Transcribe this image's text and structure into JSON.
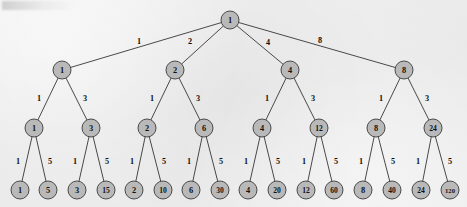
{
  "figure": {
    "kind": "divisor-tree-diagram",
    "caption": "",
    "background_color": "#ebebeb",
    "node_fill_color": "#b9b9b9",
    "node_stroke_color": "#3a3a3a",
    "edge_color": "#2a2a2a",
    "text_color": "#111111"
  },
  "chart_data": {
    "type": "diagram",
    "title": "",
    "layout": "top-down rooted tree, 4 levels, root has 4 children, all other internal nodes have 2 children",
    "levels": [
      {
        "level": 0,
        "y": 20,
        "node_count": 1
      },
      {
        "level": 1,
        "y": 70,
        "node_count": 4
      },
      {
        "level": 2,
        "y": 128,
        "node_count": 8
      },
      {
        "level": 3,
        "y": 190,
        "node_count": 16
      }
    ],
    "nodes": [
      {
        "id": "n0",
        "label": "1",
        "level": 0,
        "x": 230,
        "y": 20,
        "r": 9
      },
      {
        "id": "n1",
        "label": "1",
        "level": 1,
        "x": 62,
        "y": 70,
        "r": 9
      },
      {
        "id": "n2",
        "label": "2",
        "level": 1,
        "x": 175,
        "y": 70,
        "r": 9
      },
      {
        "id": "n3",
        "label": "4",
        "level": 1,
        "x": 290,
        "y": 70,
        "r": 9
      },
      {
        "id": "n4",
        "label": "8",
        "level": 1,
        "x": 404,
        "y": 70,
        "r": 9
      },
      {
        "id": "n1a",
        "label": "1",
        "level": 2,
        "x": 34,
        "y": 128,
        "r": 9
      },
      {
        "id": "n1b",
        "label": "3",
        "level": 2,
        "x": 91,
        "y": 128,
        "r": 9
      },
      {
        "id": "n2a",
        "label": "2",
        "level": 2,
        "x": 147,
        "y": 128,
        "r": 9
      },
      {
        "id": "n2b",
        "label": "6",
        "level": 2,
        "x": 204,
        "y": 128,
        "r": 9
      },
      {
        "id": "n3a",
        "label": "4",
        "level": 2,
        "x": 262,
        "y": 128,
        "r": 9
      },
      {
        "id": "n3b",
        "label": "12",
        "level": 2,
        "x": 319,
        "y": 128,
        "r": 9
      },
      {
        "id": "n4a",
        "label": "8",
        "level": 2,
        "x": 376,
        "y": 128,
        "r": 9
      },
      {
        "id": "n4b",
        "label": "24",
        "level": 2,
        "x": 433,
        "y": 128,
        "r": 9
      },
      {
        "id": "l1",
        "label": "1",
        "level": 3,
        "x": 20,
        "y": 190,
        "r": 9
      },
      {
        "id": "l2",
        "label": "5",
        "level": 3,
        "x": 48,
        "y": 190,
        "r": 9
      },
      {
        "id": "l3",
        "label": "3",
        "level": 3,
        "x": 77,
        "y": 190,
        "r": 9
      },
      {
        "id": "l4",
        "label": "15",
        "level": 3,
        "x": 106,
        "y": 190,
        "r": 9
      },
      {
        "id": "l5",
        "label": "2",
        "level": 3,
        "x": 134,
        "y": 190,
        "r": 9
      },
      {
        "id": "l6",
        "label": "10",
        "level": 3,
        "x": 163,
        "y": 190,
        "r": 9
      },
      {
        "id": "l7",
        "label": "6",
        "level": 3,
        "x": 191,
        "y": 190,
        "r": 9
      },
      {
        "id": "l8",
        "label": "30",
        "level": 3,
        "x": 220,
        "y": 190,
        "r": 9
      },
      {
        "id": "l9",
        "label": "4",
        "level": 3,
        "x": 248,
        "y": 190,
        "r": 9
      },
      {
        "id": "l10",
        "label": "20",
        "level": 3,
        "x": 277,
        "y": 190,
        "r": 9
      },
      {
        "id": "l11",
        "label": "12",
        "level": 3,
        "x": 306,
        "y": 190,
        "r": 9
      },
      {
        "id": "l12",
        "label": "60",
        "level": 3,
        "x": 334,
        "y": 190,
        "r": 9
      },
      {
        "id": "l13",
        "label": "8",
        "level": 3,
        "x": 363,
        "y": 190,
        "r": 9
      },
      {
        "id": "l14",
        "label": "40",
        "level": 3,
        "x": 392,
        "y": 190,
        "r": 9
      },
      {
        "id": "l15",
        "label": "24",
        "level": 3,
        "x": 421,
        "y": 190,
        "r": 9
      },
      {
        "id": "l16",
        "label": "120",
        "level": 3,
        "x": 450,
        "y": 190,
        "r": 9
      }
    ],
    "edges": [
      {
        "from": "n0",
        "to": "n1",
        "label": "1",
        "lx": 139,
        "ly": 41
      },
      {
        "from": "n0",
        "to": "n2",
        "label": "2",
        "lx": 190,
        "ly": 41
      },
      {
        "from": "n0",
        "to": "n3",
        "label": "4",
        "lx": 268,
        "ly": 42
      },
      {
        "from": "n0",
        "to": "n4",
        "label": "8",
        "lx": 320,
        "ly": 40
      },
      {
        "from": "n1",
        "to": "n1a",
        "label": "1",
        "lx": 39,
        "ly": 98
      },
      {
        "from": "n1",
        "to": "n1b",
        "label": "3",
        "lx": 85,
        "ly": 98
      },
      {
        "from": "n2",
        "to": "n2a",
        "label": "1",
        "lx": 152,
        "ly": 98
      },
      {
        "from": "n2",
        "to": "n2b",
        "label": "3",
        "lx": 198,
        "ly": 98
      },
      {
        "from": "n3",
        "to": "n3a",
        "label": "1",
        "lx": 267,
        "ly": 98
      },
      {
        "from": "n3",
        "to": "n3b",
        "label": "3",
        "lx": 313,
        "ly": 98
      },
      {
        "from": "n4",
        "to": "n4a",
        "label": "1",
        "lx": 381,
        "ly": 98
      },
      {
        "from": "n4",
        "to": "n4b",
        "label": "3",
        "lx": 427,
        "ly": 98
      },
      {
        "from": "n1a",
        "to": "l1",
        "label": "1",
        "lx": 18,
        "ly": 161
      },
      {
        "from": "n1a",
        "to": "l2",
        "label": "5",
        "lx": 50,
        "ly": 161
      },
      {
        "from": "n1b",
        "to": "l3",
        "label": "1",
        "lx": 75,
        "ly": 161
      },
      {
        "from": "n1b",
        "to": "l4",
        "label": "5",
        "lx": 107,
        "ly": 161
      },
      {
        "from": "n2a",
        "to": "l5",
        "label": "1",
        "lx": 132,
        "ly": 161
      },
      {
        "from": "n2a",
        "to": "l6",
        "label": "5",
        "lx": 164,
        "ly": 161
      },
      {
        "from": "n2b",
        "to": "l7",
        "label": "1",
        "lx": 189,
        "ly": 161
      },
      {
        "from": "n2b",
        "to": "l8",
        "label": "5",
        "lx": 221,
        "ly": 161
      },
      {
        "from": "n3a",
        "to": "l9",
        "label": "1",
        "lx": 246,
        "ly": 161
      },
      {
        "from": "n3a",
        "to": "l10",
        "label": "5",
        "lx": 278,
        "ly": 161
      },
      {
        "from": "n3b",
        "to": "l11",
        "label": "1",
        "lx": 304,
        "ly": 161
      },
      {
        "from": "n3b",
        "to": "l12",
        "label": "5",
        "lx": 336,
        "ly": 161
      },
      {
        "from": "n4a",
        "to": "l13",
        "label": "1",
        "lx": 361,
        "ly": 161
      },
      {
        "from": "n4a",
        "to": "l14",
        "label": "5",
        "lx": 393,
        "ly": 161
      },
      {
        "from": "n4b",
        "to": "l15",
        "label": "1",
        "lx": 418,
        "ly": 161
      },
      {
        "from": "n4b",
        "to": "l16",
        "label": "5",
        "lx": 450,
        "ly": 161
      }
    ]
  }
}
